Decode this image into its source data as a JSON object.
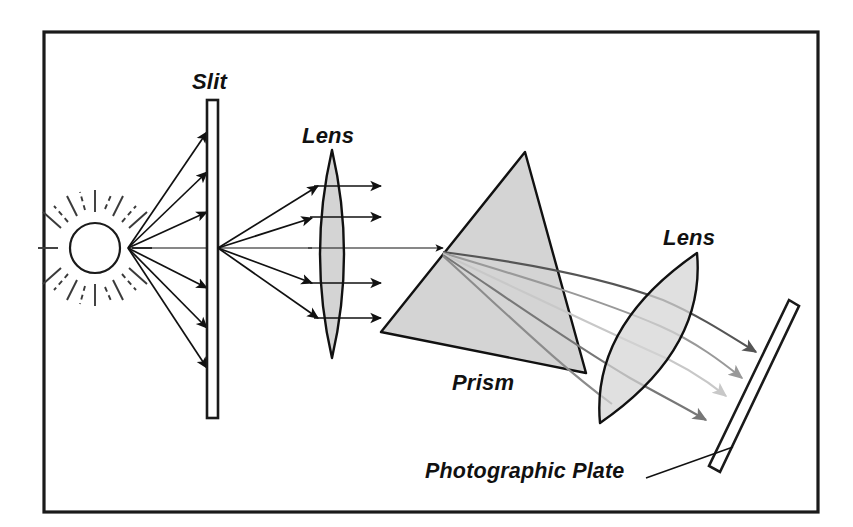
{
  "figure": {
    "width": 853,
    "height": 527,
    "background_color": "#ffffff",
    "border_color": "#1a1a1a",
    "optic_fill_color": "#d4d4d4",
    "ray_color": "#111111"
  },
  "labels": {
    "slit": "Slit",
    "lens_first": "Lens",
    "prism": "Prism",
    "lens_second": "Lens",
    "photographic_plate": "Photographic Plate"
  },
  "components": [
    {
      "name": "sun",
      "label": "",
      "kind": "light-source"
    },
    {
      "name": "slit",
      "label": "Slit",
      "kind": "aperture"
    },
    {
      "name": "lens-first",
      "label": "Lens",
      "kind": "biconvex-lens"
    },
    {
      "name": "prism",
      "label": "Prism",
      "kind": "triangular-prism"
    },
    {
      "name": "lens-second",
      "label": "Lens",
      "kind": "biconvex-lens"
    },
    {
      "name": "photographic-plate",
      "label": "Photographic Plate",
      "kind": "detector"
    }
  ],
  "dispersed_rays": [
    {
      "name": "ray-1",
      "color": "#555555"
    },
    {
      "name": "ray-2",
      "color": "#999999"
    },
    {
      "name": "ray-3",
      "color": "#c8c8c8"
    },
    {
      "name": "ray-4",
      "color": "#777777"
    },
    {
      "name": "ray-5",
      "color": "#8c8c8c"
    }
  ]
}
